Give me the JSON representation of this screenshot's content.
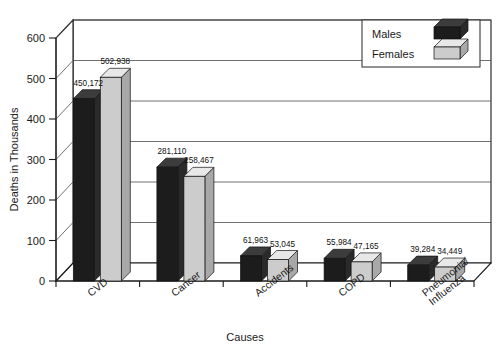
{
  "chart_data": {
    "type": "bar",
    "title": "",
    "xlabel": "Causes",
    "ylabel": "Deaths in Thousands",
    "categories": [
      "CVD",
      "Cancer",
      "Accidents",
      "COPD",
      "Pneumonia/\nInfluenza"
    ],
    "category_lines": [
      [
        "CVD"
      ],
      [
        "Cancer"
      ],
      [
        "Accidents"
      ],
      [
        "COPD"
      ],
      [
        "Pneumonia/",
        "Influenza"
      ]
    ],
    "series": [
      {
        "name": "Males",
        "color": "#1c1c1c",
        "values": [
          450172,
          281110,
          61963,
          55984,
          39284
        ],
        "labels": [
          "450,172",
          "281,110",
          "61,963",
          "55,984",
          "39,284"
        ]
      },
      {
        "name": "Females",
        "color": "#c9c9c9",
        "values": [
          502938,
          258467,
          53045,
          47165,
          34449
        ],
        "labels": [
          "502,938",
          "258,467",
          "53,045",
          "47,165",
          "34,449"
        ]
      }
    ],
    "yticks": [
      0,
      100,
      200,
      300,
      400,
      500,
      600
    ],
    "ytick_labels": [
      "0",
      "100",
      "200",
      "300",
      "400",
      "500",
      "600"
    ],
    "ylim": [
      0,
      600
    ],
    "y_units": "thousands",
    "grid": true,
    "legend_position": "top-right",
    "legend_entries": [
      "Males",
      "Females"
    ],
    "style": "3d-column"
  },
  "colors": {
    "males": "#1c1c1c",
    "males_top": "#3c3c3c",
    "males_side": "#2a2a2a",
    "females": "#cccccc",
    "females_top": "#e8e8e8",
    "females_side": "#a8a8a8",
    "axis": "#1a1a1a",
    "grid": "#4d4d4d",
    "background": "#ffffff"
  }
}
